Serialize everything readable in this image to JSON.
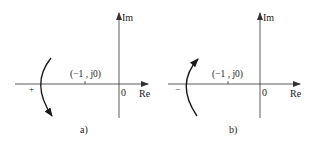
{
  "figure": {
    "colors": {
      "axis": "#333333",
      "curve": "#1a1a1a",
      "text": "#222222",
      "background": "#ffffff"
    },
    "panels": [
      {
        "id": "a",
        "caption": "a)",
        "axis_im_label": "Im",
        "axis_re_label": "Re",
        "origin_label": "0",
        "critical_point_label": "(−1 , j0)",
        "crossing_sign": "+",
        "arrow_direction": "downward",
        "crossing_description": "positive crossing (curve crosses negative real axis left of -1 from upper to lower half-plane)"
      },
      {
        "id": "b",
        "caption": "b)",
        "axis_im_label": "Im",
        "axis_re_label": "Re",
        "origin_label": "0",
        "critical_point_label": "(−1 , j0)",
        "crossing_sign": "−",
        "arrow_direction": "upward",
        "crossing_description": "negative crossing (curve crosses negative real axis left of -1 from lower to upper half-plane)"
      }
    ]
  }
}
